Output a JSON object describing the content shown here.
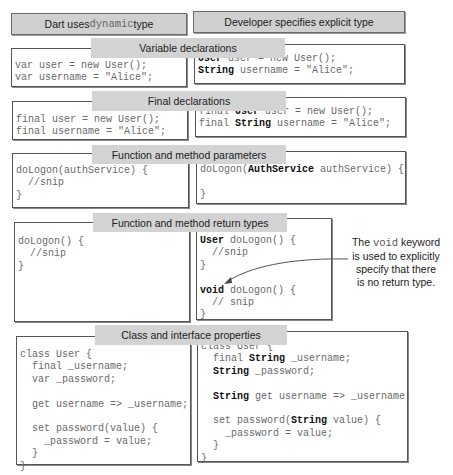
{
  "columns": {
    "left": {
      "prefix": "Dart uses ",
      "code": "dynamic",
      "suffix": " type"
    },
    "right": {
      "label": "Developer specifies explicit type"
    }
  },
  "sections": [
    {
      "title": "Variable declarations",
      "left": [
        "var user = new User();",
        "var username = \"Alice\";"
      ],
      "right": [
        [
          {
            "t": "User",
            "b": true
          },
          {
            "t": " user = new User();"
          }
        ],
        [
          {
            "t": "String",
            "b": true
          },
          {
            "t": " username = \"Alice\";"
          }
        ]
      ]
    },
    {
      "title": "Final declarations",
      "left": [
        "final user = new User();",
        "final username = \"Alice\";"
      ],
      "right": [
        [
          {
            "t": "final "
          },
          {
            "t": "User",
            "b": true
          },
          {
            "t": " user = new User();"
          }
        ],
        [
          {
            "t": "final "
          },
          {
            "t": "String",
            "b": true
          },
          {
            "t": " username = \"Alice\";"
          }
        ]
      ]
    },
    {
      "title": "Function and method parameters",
      "left": [
        "doLogon(authService) {",
        "  //snip",
        "}"
      ],
      "right": [
        [
          {
            "t": "doLogon("
          },
          {
            "t": "AuthService",
            "b": true
          },
          {
            "t": " authService) {"
          }
        ],
        [
          {
            "t": ""
          }
        ],
        [
          {
            "t": "}"
          }
        ]
      ]
    },
    {
      "title": "Function and method return types",
      "left": [
        "doLogon() {",
        "  //snip",
        "}"
      ],
      "right": [
        [
          {
            "t": "User",
            "b": true
          },
          {
            "t": " doLogon() {"
          }
        ],
        [
          {
            "t": "  //snip"
          }
        ],
        [
          {
            "t": "}"
          }
        ],
        [
          {
            "t": ""
          }
        ],
        [
          {
            "t": "void",
            "b": true
          },
          {
            "t": " doLogon() {"
          }
        ],
        [
          {
            "t": "  // snip"
          }
        ],
        [
          {
            "t": "}"
          }
        ]
      ],
      "annotation": {
        "line1_prefix": "The ",
        "line1_code": "void",
        "line1_suffix": " keyword",
        "line2": "is used to explicitly",
        "line3": "specify that there",
        "line4": "is no return type."
      }
    },
    {
      "title": "Class and interface properties",
      "left": [
        "class User {",
        "  final _username;",
        "  var _password;",
        "",
        "  get username => _username;",
        "",
        "  set password(value) {",
        "    _password = value;",
        "  }",
        "}"
      ],
      "right": [
        [
          {
            "t": "class User {"
          }
        ],
        [
          {
            "t": "  final "
          },
          {
            "t": "String",
            "b": true
          },
          {
            "t": " _username;"
          }
        ],
        [
          {
            "t": "  "
          },
          {
            "t": "String",
            "b": true
          },
          {
            "t": " _password;"
          }
        ],
        [
          {
            "t": ""
          }
        ],
        [
          {
            "t": "  "
          },
          {
            "t": "String",
            "b": true
          },
          {
            "t": " get username => _username;"
          }
        ],
        [
          {
            "t": ""
          }
        ],
        [
          {
            "t": "  set password("
          },
          {
            "t": "String",
            "b": true
          },
          {
            "t": " value) {"
          }
        ],
        [
          {
            "t": "    _password = value;"
          }
        ],
        [
          {
            "t": "  }"
          }
        ],
        [
          {
            "t": "}"
          }
        ]
      ]
    }
  ],
  "colors": {
    "header_bg": "#d0d0d0",
    "tab_bg": "#d3d3d3",
    "border": "#555555",
    "code_text": "#6a6a6a",
    "keyword_text": "#111111"
  }
}
